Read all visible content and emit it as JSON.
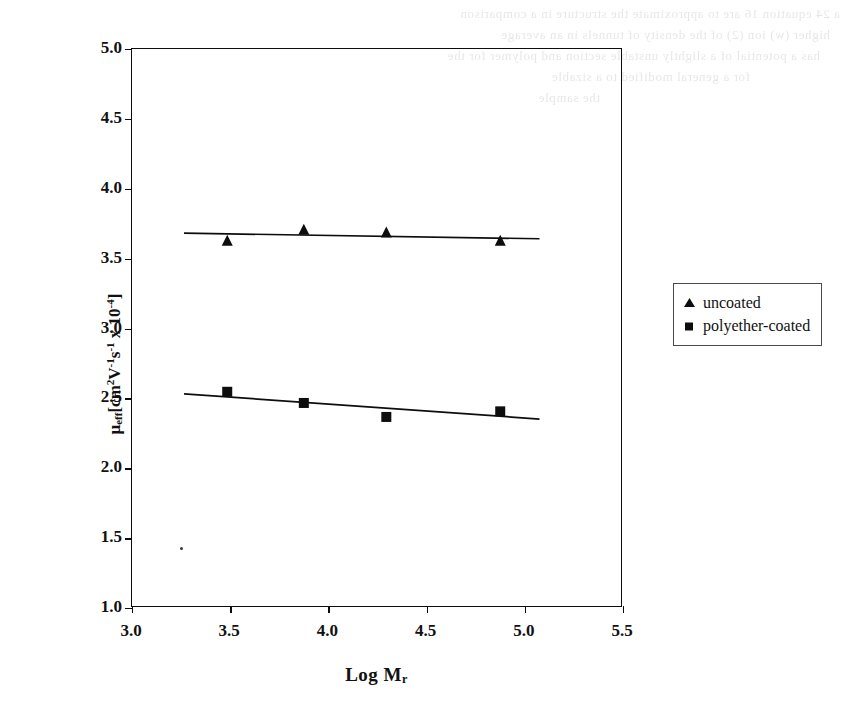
{
  "chart_data": {
    "type": "scatter",
    "title": "",
    "xlabel": "Log M_r",
    "xlabel_main": "Log M",
    "xlabel_sub": "r",
    "ylabel": "μeff[cm2V-1s-1 x 10-4]",
    "ylabel_parts": {
      "mu": "μ",
      "sub_eff": "eff",
      "bracket_open": "[cm",
      "sup_2": "2",
      "v": "V",
      "sup_neg1_a": "-1",
      "s": "s",
      "sup_neg1_b": "-1",
      "times": " x 10",
      "sup_neg4": "-4",
      "bracket_close": "]"
    },
    "xlim": [
      3.0,
      5.5
    ],
    "ylim": [
      1.0,
      5.0
    ],
    "xticks": [
      "3.0",
      "3.5",
      "4.0",
      "4.5",
      "5.0",
      "5.5"
    ],
    "xtick_values": [
      3.0,
      3.5,
      4.0,
      4.5,
      5.0,
      5.5
    ],
    "yticks": [
      "1.0",
      "1.5",
      "2.0",
      "2.5",
      "3.0",
      "3.5",
      "4.0",
      "4.5",
      "5.0"
    ],
    "ytick_values": [
      1.0,
      1.5,
      2.0,
      2.5,
      3.0,
      3.5,
      4.0,
      4.5,
      5.0
    ],
    "grid": false,
    "legend_position": "right-outside",
    "series": [
      {
        "name": "uncoated",
        "marker": "triangle",
        "color": "#0d0d0d",
        "x": [
          3.49,
          3.88,
          4.3,
          4.88
        ],
        "values": [
          3.62,
          3.7,
          3.68,
          3.62
        ],
        "trend": {
          "x_start": 3.27,
          "y_start": 3.675,
          "x_end": 5.08,
          "y_end": 3.635
        }
      },
      {
        "name": "polyether-coated",
        "marker": "square",
        "color": "#0d0d0d",
        "x": [
          3.49,
          3.88,
          4.3,
          4.88
        ],
        "values": [
          2.54,
          2.46,
          2.36,
          2.4
        ],
        "trend": {
          "x_start": 3.27,
          "y_start": 2.525,
          "x_end": 5.08,
          "y_end": 2.345
        }
      }
    ]
  },
  "legend": {
    "entries": [
      {
        "label": "uncoated",
        "marker": "triangle"
      },
      {
        "label": "polyether-coated",
        "marker": "square"
      }
    ]
  },
  "ghost_text": {
    "lines": [
      "a 24 equation 16 are to approximate the structure in a comparison",
      "higher  (w) ion (2) of the density of tunnels  in an average",
      "has a  potential of a slightly unstable section and polymer for the",
      "for a general modified to a sizable",
      "the sample"
    ]
  }
}
